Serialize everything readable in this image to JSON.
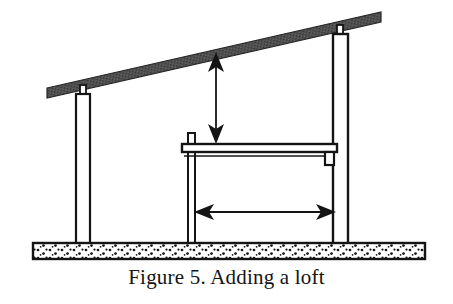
{
  "figure": {
    "caption": "Figure 5. Adding a loft",
    "title": "Adding a loft",
    "number": "Figure 5.",
    "domain_kind": "technical-line-drawing"
  },
  "colors": {
    "ink": "#141414",
    "roof_fill": "#4f4f4f",
    "roof_stroke": "#262626",
    "slab_fill": "#ffffff",
    "slab_stroke": "#141414",
    "aggregate_dot": "#141414",
    "post_fill": "#ffffff",
    "background": "#ffffff",
    "arrow": "#141414"
  },
  "parts": {
    "roof_beam": {
      "label": "sloped roof beam",
      "left_end_x": 47,
      "left_end_y": 88,
      "right_end_x": 381,
      "right_end_y": 12,
      "thickness": 10,
      "shading": "hatched-dark-gray"
    },
    "left_post": {
      "label": "left support post",
      "x": 76,
      "y_top": 94,
      "width": 14,
      "y_bottom": 245,
      "has_tenon": true,
      "tenon_width": 6,
      "tenon_height": 9
    },
    "right_post": {
      "label": "right support post",
      "x": 333,
      "y_top": 34,
      "width": 15,
      "y_bottom": 245,
      "has_tenon": true,
      "tenon_width": 6,
      "tenon_height": 9
    },
    "loft_post": {
      "label": "loft left post",
      "x": 188,
      "y_top": 133,
      "width": 7,
      "y_bottom": 245
    },
    "loft_beam": {
      "label": "loft floor beam",
      "x_left": 182,
      "x_right": 337,
      "y_top": 144,
      "rail_height": 8,
      "ledger_y": 155
    },
    "joist_hanger": {
      "label": "joist hanger bracket",
      "x": 325,
      "y": 152,
      "width": 9,
      "height": 13
    },
    "slab": {
      "label": "concrete slab foundation",
      "x": 33,
      "y": 243,
      "width": 392,
      "height": 16
    }
  },
  "annotations": {
    "headroom_arrow": {
      "name": "headroom-dimension-arrow",
      "orientation": "vertical",
      "x": 216,
      "y_top": 54,
      "y_bottom": 142,
      "double_headed": true,
      "measures": "clear height from loft floor to roof"
    },
    "span_arrow": {
      "name": "loft-span-dimension-arrow",
      "orientation": "horizontal",
      "y": 212,
      "x_left": 196,
      "x_right": 333,
      "double_headed": true,
      "measures": "loft span between posts"
    }
  }
}
